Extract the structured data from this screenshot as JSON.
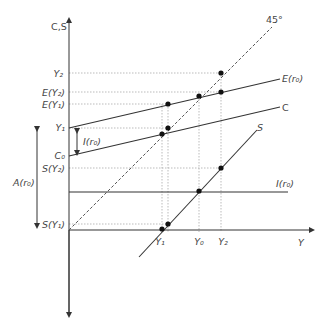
{
  "axes": {
    "y_label": "C,S",
    "x_label": "Y"
  },
  "lines": {
    "forty_five": "45°",
    "expenditure": "E(r₀)",
    "consumption": "C",
    "saving": "S",
    "investment": "I(r₀)"
  },
  "y_ticks": {
    "y2": "Y₂",
    "e_y2": "E(Y₂)",
    "e_y1": "E(Y₁)",
    "y1": "Y₁",
    "c0": "C₀",
    "s_y2": "S(Y₂)",
    "s_y1": "S(Y₁)"
  },
  "x_ticks": {
    "y1": "Y₁",
    "y0": "Y₀",
    "y2": "Y₂"
  },
  "annotations": {
    "investment_gap": "I(r₀)",
    "autonomous": "A(r₀)"
  },
  "colors": {
    "line": "#333333",
    "guide": "#999999",
    "text": "#444444"
  }
}
